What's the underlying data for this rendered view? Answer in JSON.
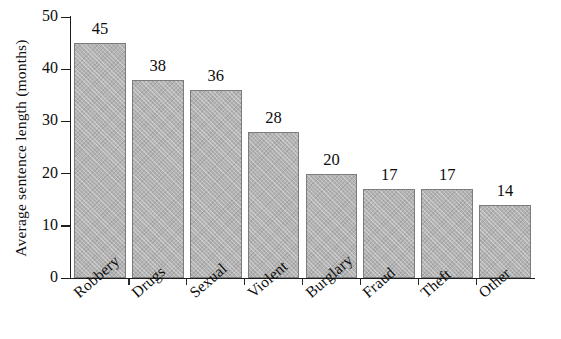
{
  "chart_data": {
    "type": "bar",
    "title": "",
    "xlabel": "",
    "ylabel": "Average sentence length  (months)",
    "categories": [
      "Robbery",
      "Drugs",
      "Sexual",
      "Violent",
      "Burglary",
      "Fraud",
      "Theft",
      "Other"
    ],
    "values": [
      45,
      38,
      36,
      28,
      20,
      17,
      17,
      14
    ],
    "value_labels": [
      "45",
      "38",
      "36",
      "28",
      "20",
      "17",
      "17",
      "14"
    ],
    "ylim": [
      0,
      50
    ],
    "y_ticks": [
      0,
      10,
      20,
      30,
      40,
      50
    ],
    "y_tick_labels": [
      "0",
      "10",
      "20",
      "30",
      "40",
      "50"
    ],
    "grid": false,
    "legend": false,
    "bar_fill_color": "#b3b3b3",
    "bar_edge_color": "#7c7c7c",
    "axis_color": "#1d1d1d",
    "background_color": "#ffffff",
    "label_rotation": -41
  }
}
